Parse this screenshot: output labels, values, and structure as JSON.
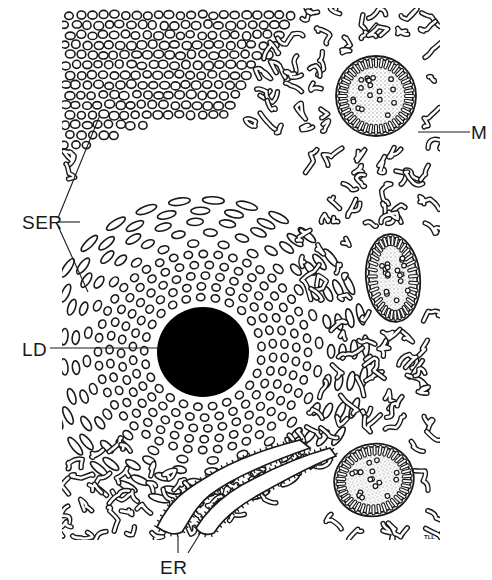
{
  "figure": {
    "type": "electron-micrograph-style line drawing",
    "colors": {
      "ink": "#1a1a1a",
      "background": "#ffffff",
      "stipple": "#9a9a9a"
    },
    "frame": {
      "x": 62,
      "y": 8,
      "width": 378,
      "height": 532
    },
    "signature": "TLL"
  },
  "labels": [
    {
      "id": "SER",
      "text": "SER",
      "x": 22,
      "y": 213,
      "meaning": "smooth endoplasmic reticulum",
      "leaders": [
        [
          [
            58,
            218
          ],
          [
            100,
            115
          ]
        ],
        [
          [
            58,
            222
          ],
          [
            80,
            222
          ]
        ],
        [
          [
            58,
            226
          ],
          [
            88,
            292
          ]
        ]
      ]
    },
    {
      "id": "M",
      "text": "M",
      "x": 471,
      "y": 123,
      "meaning": "mitochondrion",
      "leaders": [
        [
          [
            418,
            132
          ],
          [
            470,
            132
          ]
        ]
      ]
    },
    {
      "id": "LD",
      "text": "LD",
      "x": 22,
      "y": 340,
      "meaning": "lipid droplet",
      "leaders": [
        [
          [
            50,
            348
          ],
          [
            160,
            348
          ]
        ]
      ]
    },
    {
      "id": "ER",
      "text": "ER",
      "x": 160,
      "y": 558,
      "meaning": "rough endoplasmic reticulum",
      "leaders": [
        [
          [
            178,
            553
          ],
          [
            178,
            536
          ]
        ],
        [
          [
            188,
            553
          ],
          [
            201,
            532
          ]
        ]
      ]
    }
  ],
  "organelles": {
    "lipid_droplet": {
      "cx": 203,
      "cy": 352,
      "rx": 46,
      "ry": 45
    },
    "mitochondria": [
      {
        "cx": 376,
        "cy": 96,
        "rx": 40,
        "ry": 40,
        "rot": 0
      },
      {
        "cx": 393,
        "cy": 278,
        "rx": 27,
        "ry": 44,
        "rot": -5
      },
      {
        "cx": 374,
        "cy": 480,
        "rx": 40,
        "ry": 36,
        "rot": -15
      }
    ],
    "rough_er": [
      {
        "path": "M 157 527 C 170 500, 185 490, 205 478 C 230 462, 260 450, 300 440 L 310 448 C 270 462, 232 478, 210 495 C 196 506, 190 520, 182 532 C 175 536, 165 533, 157 527 Z"
      },
      {
        "path": "M 196 528 C 210 505, 230 490, 255 478 C 280 465, 305 455, 330 448 L 336 456 C 310 466, 285 480, 262 493 C 240 505, 222 520, 214 533 C 207 536, 200 534, 196 528 Z"
      }
    ]
  }
}
